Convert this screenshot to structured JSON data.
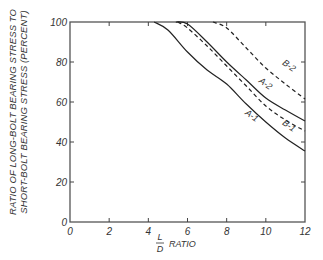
{
  "chart_data": {
    "type": "line",
    "title": "",
    "xlabel": "L/D RATIO",
    "xlabel_parts": {
      "numerator": "L",
      "denominator": "D",
      "suffix": "RATIO"
    },
    "ylabel": "RATIO OF LONG-BOLT BEARING STRESS TO SHORT-BOLT BEARING STRESS (PERCENT)",
    "ylabel_lines": [
      "RATIO OF LONG-BOLT BEARING STRESS TO",
      "SHORT-BOLT BEARING STRESS (PERCENT)"
    ],
    "xlim": [
      0,
      12
    ],
    "ylim": [
      0,
      100
    ],
    "xticks": [
      0,
      2,
      4,
      6,
      8,
      10,
      12
    ],
    "yticks": [
      0,
      20,
      40,
      60,
      80,
      100
    ],
    "grid": false,
    "legend": "inline curve labels",
    "series": [
      {
        "name": "A-1",
        "style": "solid",
        "x": [
          4.3,
          5,
          6,
          7,
          8,
          9,
          10,
          11,
          12
        ],
        "y": [
          100,
          96,
          85,
          76,
          69,
          59,
          50,
          42,
          35.5
        ]
      },
      {
        "name": "A-2",
        "style": "solid",
        "x": [
          5.4,
          6,
          7,
          8,
          9,
          10,
          11,
          12
        ],
        "y": [
          100,
          99,
          90,
          80,
          71,
          62,
          56,
          50.5
        ]
      },
      {
        "name": "B-1",
        "style": "dashed",
        "x": [
          5.5,
          6,
          7,
          8,
          9,
          10,
          11,
          12
        ],
        "y": [
          100,
          97,
          88,
          78,
          68,
          58,
          51,
          45.5
        ]
      },
      {
        "name": "B-2",
        "style": "dashed",
        "x": [
          7.3,
          8,
          9,
          10,
          11,
          12
        ],
        "y": [
          100,
          97,
          87,
          77,
          69,
          61.5
        ]
      }
    ],
    "labels": [
      {
        "text": "A-1",
        "x": 9.2,
        "y": 52,
        "angle": 35
      },
      {
        "text": "A-2",
        "x": 9.9,
        "y": 68,
        "angle": 35
      },
      {
        "text": "B-1",
        "x": 11.1,
        "y": 47,
        "angle": 35
      },
      {
        "text": "B-2",
        "x": 11.1,
        "y": 77,
        "angle": 35
      }
    ]
  }
}
